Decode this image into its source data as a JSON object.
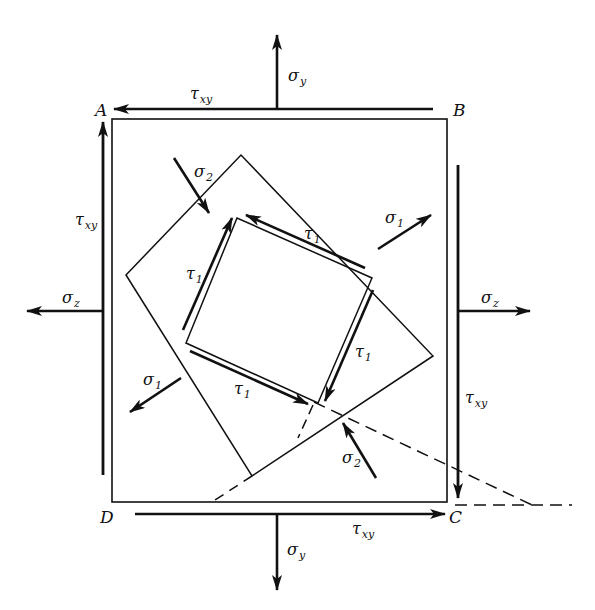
{
  "diagram": {
    "type": "plane-stress-element",
    "colors": {
      "line": "#111111",
      "background": "#ffffff"
    },
    "corners": {
      "A": "A",
      "B": "B",
      "C": "C",
      "D": "D"
    },
    "labels": {
      "sigma_y_top": {
        "base": "σ",
        "sub": "y"
      },
      "sigma_y_bottom": {
        "base": "σ",
        "sub": "y"
      },
      "sigma_z_left": {
        "base": "σ",
        "sub": "z"
      },
      "sigma_z_right": {
        "base": "σ",
        "sub": "z"
      },
      "tau_xy_top": {
        "base": "τ",
        "sub": "xy"
      },
      "tau_xy_left": {
        "base": "τ",
        "sub": "xy"
      },
      "tau_xy_right": {
        "base": "τ",
        "sub": "xy"
      },
      "tau_xy_bottom": {
        "base": "τ",
        "sub": "xy"
      },
      "sigma_2_upper": {
        "base": "σ",
        "sub": "2"
      },
      "sigma_2_lower": {
        "base": "σ",
        "sub": "2"
      },
      "sigma_1_right": {
        "base": "σ",
        "sub": "1"
      },
      "sigma_1_left": {
        "base": "σ",
        "sub": "1"
      },
      "tau_1_top": {
        "base": "τ",
        "sub": "1"
      },
      "tau_1_left": {
        "base": "τ",
        "sub": "1"
      },
      "tau_1_right": {
        "base": "τ",
        "sub": "1"
      },
      "tau_1_bottom": {
        "base": "τ",
        "sub": "1"
      }
    }
  }
}
